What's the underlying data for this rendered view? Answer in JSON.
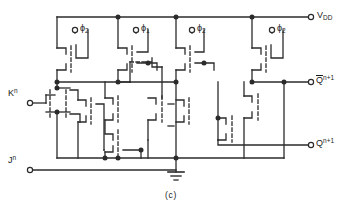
{
  "figure": {
    "caption": "(c)",
    "stroke_color": "#2b2b2b",
    "background": "#ffffff"
  },
  "terminals": {
    "supply": {
      "name": "V_DD",
      "text": "V",
      "sub": "DD",
      "x": 318,
      "y": 17
    },
    "clock_phi2_a": {
      "text": "ϕ",
      "sub": "2",
      "x": 79,
      "y": 31
    },
    "clock_phi1": {
      "text": "ϕ",
      "sub": "1",
      "x": 140,
      "y": 31
    },
    "clock_phi2_b": {
      "text": "ϕ",
      "sub": "2",
      "x": 196,
      "y": 31
    },
    "clock_phi2_c": {
      "text": "ϕ",
      "sub": "2",
      "x": 276,
      "y": 31
    },
    "input_k": {
      "text": "K",
      "sup": "n",
      "x": 8,
      "y": 96
    },
    "input_j": {
      "text": "J",
      "sup": "n",
      "x": 8,
      "y": 162
    },
    "output_qbar": {
      "text": "Q",
      "sup": "n+1",
      "overbar": true,
      "x": 316,
      "y": 79
    },
    "output_q": {
      "text": "Q",
      "sup": "n+1",
      "overbar": false,
      "x": 316,
      "y": 140
    },
    "ground": {
      "name": "ground",
      "x": 181,
      "y": 170
    }
  },
  "labels": [
    {
      "id": "vdd",
      "text": "V",
      "sub": "DD",
      "sup": ""
    },
    {
      "id": "phi2a",
      "text": "ϕ",
      "sub": "2",
      "sup": ""
    },
    {
      "id": "phi1",
      "text": "ϕ",
      "sub": "1",
      "sup": ""
    },
    {
      "id": "phi2b",
      "text": "ϕ",
      "sub": "2",
      "sup": ""
    },
    {
      "id": "phi2c",
      "text": "ϕ",
      "sub": "2",
      "sup": ""
    },
    {
      "id": "kn",
      "text": "K",
      "sub": "",
      "sup": "n"
    },
    {
      "id": "jn",
      "text": "J",
      "sub": "",
      "sup": "n"
    },
    {
      "id": "qbar",
      "text": "Q",
      "sub": "",
      "sup": "n+1"
    },
    {
      "id": "q",
      "text": "Q",
      "sub": "",
      "sup": "n+1"
    }
  ],
  "counts": {
    "transistors": 14,
    "clock_inputs": 4,
    "data_inputs": 2,
    "outputs": 2,
    "supply_rails": 1,
    "ground_nodes": 1
  }
}
